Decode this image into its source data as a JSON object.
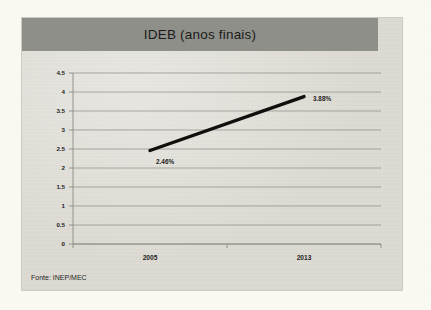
{
  "card": {
    "title": "IDEB (anos finais)",
    "source_note": "Fonte: INEP/MEC"
  },
  "chart_data": {
    "type": "line",
    "title": "IDEB (anos finais)",
    "xlabel": "",
    "ylabel": "",
    "categories": [
      "2005",
      "2013"
    ],
    "x": [
      2005,
      2013
    ],
    "values": [
      2.46,
      3.88
    ],
    "point_labels": [
      "2.46%",
      "3.88%"
    ],
    "series": [
      {
        "name": "IDEB (anos finais)",
        "values": [
          2.46,
          3.88
        ],
        "color": "#100f0d"
      }
    ],
    "ylim": [
      0,
      4.5
    ],
    "ytick_labels": [
      "0",
      "0.5",
      "1",
      "1.5",
      "2",
      "2.5",
      "3",
      "3.5",
      "4",
      "4.5"
    ],
    "ytick_values": [
      0,
      0.5,
      1,
      1.5,
      2,
      2.5,
      3,
      3.5,
      4,
      4.5
    ],
    "xtick_labels": [
      "2005",
      "2013"
    ],
    "grid": true,
    "grid_axis": "y",
    "legend": false,
    "legend_position": "none",
    "annotations": [
      "Fonte: INEP/MEC"
    ]
  },
  "colors": {
    "page_background": "#fbfbf4",
    "card_background": "#dedcd4",
    "title_band": "#8f8f8a",
    "gridline": "#8b8a84",
    "series": "#100f0d",
    "text": "#1d1d1d"
  }
}
